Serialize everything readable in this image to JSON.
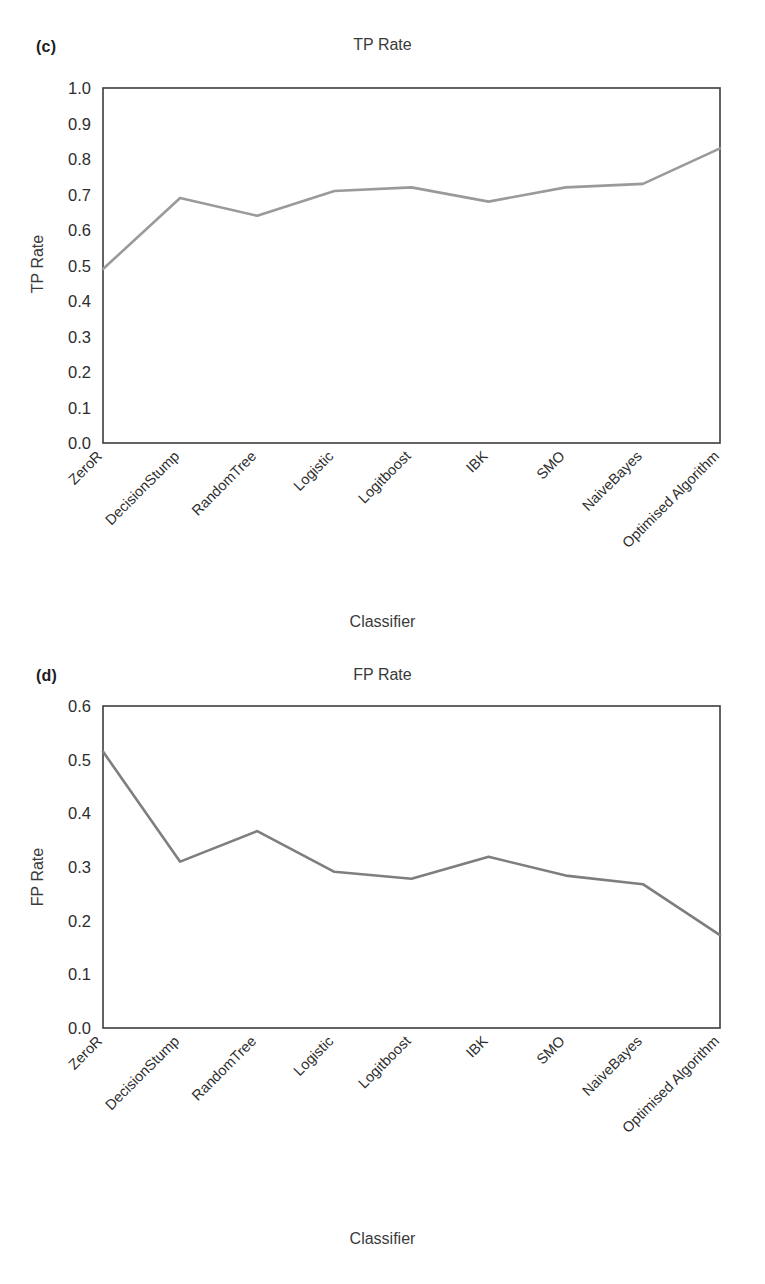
{
  "figure": {
    "panel_c_letter": "(c)",
    "panel_d_letter": "(d)"
  },
  "chart_data": [
    {
      "id": "tp-rate",
      "type": "line",
      "title": "TP Rate",
      "xlabel": "Classifier",
      "ylabel": "TP Rate",
      "ylim": [
        0.0,
        1.0
      ],
      "ytick_labels": [
        "1.0",
        "0.9",
        "0.8",
        "0.7",
        "0.6",
        "0.5",
        "0.4",
        "0.3",
        "0.2",
        "0.1",
        "0.0"
      ],
      "yticks": [
        1.0,
        0.9,
        0.8,
        0.7,
        0.6,
        0.5,
        0.4,
        0.3,
        0.2,
        0.1,
        0.0
      ],
      "grid": false,
      "legend": "none",
      "line_color": "#9a9a9a",
      "categories": [
        "ZeroR",
        "DecisionStump",
        "RandomTree",
        "Logistic",
        "Logitboost",
        "IBK",
        "SMO",
        "NaiveBayes",
        "Optimised Algorithm"
      ],
      "values": [
        0.49,
        0.69,
        0.64,
        0.71,
        0.72,
        0.68,
        0.72,
        0.73,
        0.83
      ]
    },
    {
      "id": "fp-rate",
      "type": "line",
      "title": "FP Rate",
      "xlabel": "Classifier",
      "ylabel": "FP Rate",
      "ylim": [
        0.0,
        0.6
      ],
      "ytick_labels": [
        "0.6",
        "0.5",
        "0.4",
        "0.3",
        "0.2",
        "0.1",
        "0.0"
      ],
      "yticks": [
        0.6,
        0.5,
        0.4,
        0.3,
        0.2,
        0.1,
        0.0
      ],
      "grid": false,
      "legend": "none",
      "line_color": "#7e7e7e",
      "categories": [
        "ZeroR",
        "DecisionStump",
        "RandomTree",
        "Logistic",
        "Logitboost",
        "IBK",
        "SMO",
        "NaiveBayes",
        "Optimised Algorithm"
      ],
      "values": [
        0.515,
        0.31,
        0.367,
        0.291,
        0.278,
        0.319,
        0.284,
        0.268,
        0.173
      ]
    }
  ]
}
